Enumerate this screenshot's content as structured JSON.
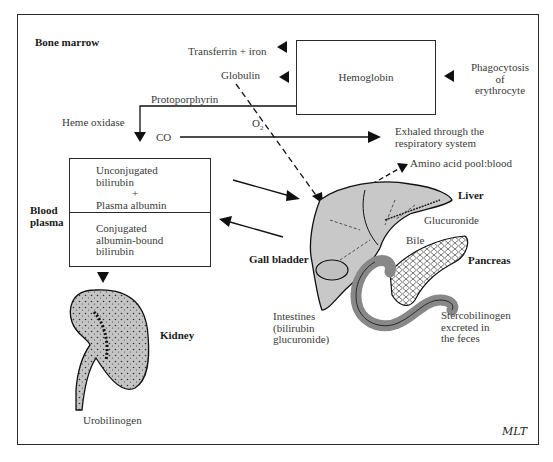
{
  "diagram": {
    "regions": {
      "bone_marrow": "Bone marrow",
      "blood_plasma_line1": "Blood",
      "blood_plasma_line2": "plasma"
    },
    "hemoglobin_box": {
      "label": "Hemoglobin"
    },
    "products": {
      "transferrin": "Transferrin + iron",
      "globulin": "Globulin",
      "protoporphyrin": "Protoporphyrin",
      "heme_oxidase": "Heme oxidase",
      "co": "CO",
      "o2": "O",
      "o2_sub": "2"
    },
    "phagocytosis": {
      "line1": "Phagocytosis",
      "line2": "of",
      "line3": "erythrocyte"
    },
    "exhaled": {
      "line1": "Exhaled through the",
      "line2": "respiratory system"
    },
    "amino_acid": "Amino acid pool:blood",
    "plasma_box": {
      "top": {
        "line1": "Unconjugated",
        "line2": "bilirubin",
        "line3": "+",
        "line4": "Plasma albumin"
      },
      "bottom": {
        "line1": "Conjugated",
        "line2": "albumin-bound",
        "line3": "bilirubin"
      }
    },
    "organs": {
      "liver": "Liver",
      "glucuronide": "Glucuronide",
      "bile": "Bile",
      "gall_bladder": "Gall bladder",
      "pancreas": "Pancreas",
      "kidney": "Kidney"
    },
    "intestines": {
      "line1": "Intestines",
      "line2": "(bilirubin",
      "line3": "glucuronide)"
    },
    "stercobilinogen": {
      "line1": "Stercobilinogen",
      "line2": "excreted in",
      "line3": "the feces"
    },
    "urobilinogen": "Urobilinogen",
    "signature": "MLT",
    "colors": {
      "organ_fill": "#c8c8c8",
      "line": "#1a1a1a"
    }
  }
}
